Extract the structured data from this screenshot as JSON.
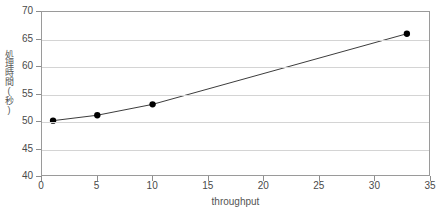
{
  "chart_data": {
    "type": "line",
    "title": "",
    "xlabel": "throughput",
    "ylabel": "処理時間(秒)",
    "xlim": [
      0,
      35
    ],
    "ylim": [
      40,
      70
    ],
    "xticks": [
      0,
      5,
      10,
      15,
      20,
      25,
      30,
      35
    ],
    "yticks": [
      40,
      45,
      50,
      55,
      60,
      65,
      70
    ],
    "grid": "horizontal",
    "legend": "none",
    "markers": "filled-circle",
    "series": [
      {
        "name": "処理時間(秒)",
        "x": [
          1,
          5,
          10,
          33
        ],
        "y": [
          50,
          51,
          53,
          66
        ],
        "color": "#3a3a3a"
      }
    ]
  },
  "colors": {
    "line": "#3a3a3a",
    "marker": "#000000",
    "grid": "#d4d4d4",
    "frame": "#9a9a9a",
    "tick_text": "#4a4a4a",
    "axis_title": "#555555",
    "background": "#ffffff"
  }
}
